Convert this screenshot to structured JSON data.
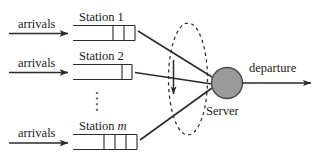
{
  "diagram": {
    "background_color": "#ffffff",
    "stroke_color": "#2b2b2b",
    "server_fill_color": "#9a9a9a",
    "server_stroke_color": "#4a4a4a"
  },
  "arrivals": [
    {
      "label": "arrivals"
    },
    {
      "label": "arrivals"
    },
    {
      "label": "arrivals"
    }
  ],
  "stations": [
    {
      "name": "Station",
      "index": "1",
      "index_italic": false,
      "cells": 2
    },
    {
      "name": "Station",
      "index": "2",
      "index_italic": false,
      "cells": 1
    },
    {
      "name": "Station",
      "index": "m",
      "index_italic": true,
      "cells": 3
    }
  ],
  "ellipsis": {
    "dots": 4
  },
  "server": {
    "label": "Server"
  },
  "output": {
    "label": "departure"
  },
  "icons": {
    "arrow_right": "arrow-right-icon",
    "arrow_down": "arrow-down-icon",
    "dashed_ellipse": "dashed-ellipse-icon"
  }
}
